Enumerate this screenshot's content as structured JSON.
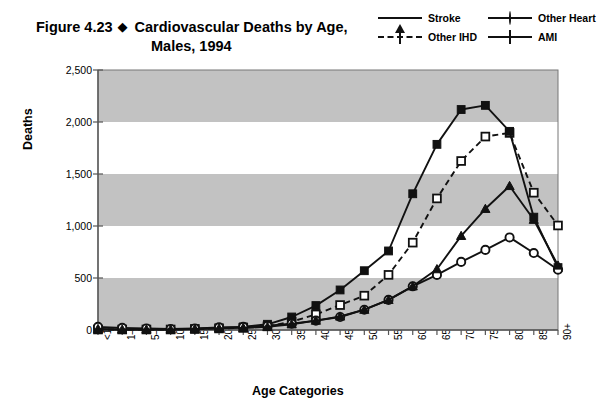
{
  "figure": {
    "number": "Figure 4.23",
    "bullet": "◆",
    "title_line1": "Cardiovascular Deaths by Age,",
    "title_line2": "Males, 1994"
  },
  "legend": {
    "position": "top-right",
    "entries": [
      {
        "label": "Stroke",
        "marker": "triangle-filled",
        "line": "solid",
        "color": "#111111"
      },
      {
        "label": "Other Heart",
        "marker": "circle-open",
        "line": "solid",
        "color": "#111111"
      },
      {
        "label": "Other IHD",
        "marker": "square-open",
        "line": "dashed",
        "color": "#111111"
      },
      {
        "label": "AMI",
        "marker": "square-filled",
        "line": "solid",
        "color": "#111111"
      }
    ]
  },
  "axes": {
    "xlabel": "Age Categories",
    "ylabel": "Deaths",
    "yticks": [
      "0",
      "500",
      "1,000",
      "1,500",
      "2,000",
      "2,500"
    ],
    "ylim": [
      0,
      2500
    ],
    "band_color": "#c2c2c2",
    "plot_bg": "#ffffff"
  },
  "chart_data": {
    "type": "line",
    "title": "Cardiovascular Deaths by Age, Males, 1994",
    "xlabel": "Age Categories",
    "ylabel": "Deaths",
    "ylim": [
      0,
      2500
    ],
    "ytick_values": [
      0,
      500,
      1000,
      1500,
      2000,
      2500
    ],
    "grid": "horizontal-bands",
    "legend_position": "top-right",
    "categories": [
      "<1",
      "1–4",
      "5–9",
      "10–14",
      "15–19",
      "20–24",
      "25–29",
      "30–34",
      "35–39",
      "40–44",
      "45–49",
      "50–54",
      "55–59",
      "60–64",
      "65–69",
      "70–74",
      "75–79",
      "80–84",
      "85–89",
      "90+"
    ],
    "series": [
      {
        "name": "Stroke",
        "marker": "triangle-filled",
        "line": "solid",
        "values": [
          10,
          5,
          5,
          5,
          10,
          15,
          20,
          30,
          55,
          90,
          130,
          195,
          290,
          420,
          585,
          905,
          1165,
          1385,
          1060,
          620
        ]
      },
      {
        "name": "Other IHD",
        "marker": "square-open",
        "line": "dashed",
        "values": [
          5,
          5,
          5,
          5,
          10,
          15,
          20,
          35,
          80,
          150,
          240,
          330,
          530,
          840,
          1265,
          1625,
          1860,
          1895,
          1320,
          1005
        ]
      },
      {
        "name": "AMI",
        "marker": "square-filled",
        "line": "solid",
        "values": [
          5,
          5,
          5,
          5,
          10,
          20,
          30,
          55,
          125,
          235,
          385,
          570,
          760,
          1310,
          1785,
          2120,
          2160,
          1910,
          1085,
          600
        ]
      },
      {
        "name": "Other Heart",
        "marker": "circle-open",
        "line": "solid",
        "values": [
          30,
          20,
          15,
          10,
          15,
          25,
          30,
          40,
          60,
          90,
          125,
          195,
          290,
          420,
          530,
          655,
          770,
          890,
          740,
          580
        ]
      }
    ]
  }
}
